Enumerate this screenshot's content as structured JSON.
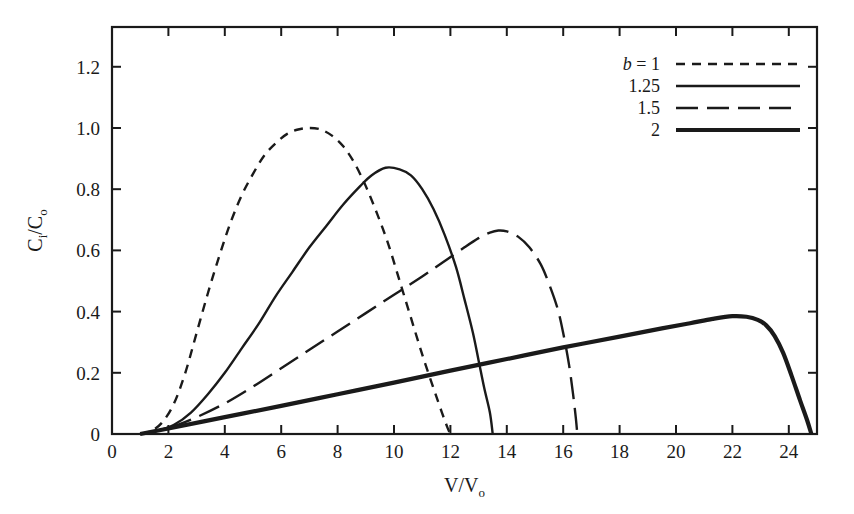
{
  "chart_data": {
    "type": "line",
    "title": "",
    "xlabel": "V/Vₒ",
    "xlabel_main": "V/V",
    "xlabel_sub": "o",
    "ylabel": "Cᵢ/Cₒ",
    "ylabel_main": "C/C",
    "ylabel_sub_1": "i",
    "ylabel_sub_2": "o",
    "xlim": [
      0,
      25
    ],
    "ylim": [
      0,
      1.33
    ],
    "xticks": [
      0,
      2,
      4,
      6,
      8,
      10,
      12,
      14,
      16,
      18,
      20,
      22,
      24
    ],
    "xtick_labels": [
      "0",
      "2",
      "4",
      "6",
      "8",
      "10",
      "12",
      "14",
      "16",
      "18",
      "20",
      "22",
      "24"
    ],
    "yticks": [
      0,
      0.2,
      0.4,
      0.6,
      0.8,
      1.0,
      1.2
    ],
    "ytick_labels": [
      "0",
      "0.2",
      "0.4",
      "0.6",
      "0.8",
      "1.0",
      "1.2"
    ],
    "grid": false,
    "ticks_inward": true,
    "ticks_on_top": true,
    "ticks_on_right": true,
    "legend_position": "top-right",
    "legend_prefix": "b =",
    "series": [
      {
        "name": "1",
        "legend_label": "1",
        "style": "short-dash",
        "dasharray": "9,7",
        "width": 2.4,
        "peak_x": 7.0,
        "peak_y": 1.0,
        "points": [
          [
            1.0,
            0.0
          ],
          [
            1.4,
            0.01
          ],
          [
            1.8,
            0.04
          ],
          [
            2.2,
            0.1
          ],
          [
            2.6,
            0.2
          ],
          [
            3.0,
            0.33
          ],
          [
            3.4,
            0.46
          ],
          [
            3.8,
            0.58
          ],
          [
            4.2,
            0.69
          ],
          [
            4.6,
            0.78
          ],
          [
            5.0,
            0.85
          ],
          [
            5.4,
            0.91
          ],
          [
            5.8,
            0.95
          ],
          [
            6.2,
            0.98
          ],
          [
            6.6,
            0.995
          ],
          [
            7.0,
            1.0
          ],
          [
            7.4,
            0.995
          ],
          [
            7.8,
            0.975
          ],
          [
            8.2,
            0.94
          ],
          [
            8.6,
            0.885
          ],
          [
            9.0,
            0.81
          ],
          [
            9.4,
            0.72
          ],
          [
            9.8,
            0.62
          ],
          [
            10.2,
            0.5
          ],
          [
            10.6,
            0.38
          ],
          [
            11.0,
            0.26
          ],
          [
            11.4,
            0.15
          ],
          [
            11.7,
            0.07
          ],
          [
            11.9,
            0.02
          ],
          [
            12.0,
            0.0
          ]
        ]
      },
      {
        "name": "1.25",
        "legend_label": "1.25",
        "style": "solid-thin",
        "dasharray": "none",
        "width": 2.4,
        "peak_x": 9.7,
        "peak_y": 0.87,
        "points": [
          [
            1.0,
            0.0
          ],
          [
            1.6,
            0.01
          ],
          [
            2.2,
            0.03
          ],
          [
            2.8,
            0.07
          ],
          [
            3.4,
            0.13
          ],
          [
            4.0,
            0.2
          ],
          [
            4.6,
            0.28
          ],
          [
            5.2,
            0.36
          ],
          [
            5.8,
            0.45
          ],
          [
            6.4,
            0.53
          ],
          [
            7.0,
            0.61
          ],
          [
            7.6,
            0.68
          ],
          [
            8.2,
            0.75
          ],
          [
            8.8,
            0.81
          ],
          [
            9.2,
            0.845
          ],
          [
            9.7,
            0.87
          ],
          [
            10.2,
            0.865
          ],
          [
            10.6,
            0.845
          ],
          [
            11.0,
            0.8
          ],
          [
            11.4,
            0.735
          ],
          [
            11.8,
            0.65
          ],
          [
            12.2,
            0.545
          ],
          [
            12.5,
            0.44
          ],
          [
            12.8,
            0.33
          ],
          [
            13.0,
            0.24
          ],
          [
            13.2,
            0.15
          ],
          [
            13.4,
            0.07
          ],
          [
            13.5,
            0.0
          ]
        ]
      },
      {
        "name": "1.5",
        "legend_label": "1.5",
        "style": "long-dash",
        "dasharray": "22,9",
        "width": 2.4,
        "peak_x": 13.7,
        "peak_y": 0.665,
        "points": [
          [
            1.0,
            0.0
          ],
          [
            2.0,
            0.02
          ],
          [
            3.0,
            0.055
          ],
          [
            4.0,
            0.1
          ],
          [
            5.0,
            0.155
          ],
          [
            6.0,
            0.215
          ],
          [
            7.0,
            0.275
          ],
          [
            8.0,
            0.335
          ],
          [
            9.0,
            0.395
          ],
          [
            10.0,
            0.455
          ],
          [
            11.0,
            0.515
          ],
          [
            11.8,
            0.565
          ],
          [
            12.5,
            0.61
          ],
          [
            13.0,
            0.64
          ],
          [
            13.4,
            0.658
          ],
          [
            13.7,
            0.665
          ],
          [
            14.0,
            0.662
          ],
          [
            14.4,
            0.645
          ],
          [
            14.8,
            0.61
          ],
          [
            15.2,
            0.555
          ],
          [
            15.5,
            0.49
          ],
          [
            15.8,
            0.41
          ],
          [
            16.0,
            0.33
          ],
          [
            16.2,
            0.23
          ],
          [
            16.35,
            0.13
          ],
          [
            16.45,
            0.05
          ],
          [
            16.5,
            0.0
          ]
        ]
      },
      {
        "name": "2",
        "legend_label": "2",
        "style": "solid-thick",
        "dasharray": "none",
        "width": 4.2,
        "peak_x": 22.0,
        "peak_y": 0.385,
        "points": [
          [
            1.0,
            0.0
          ],
          [
            2.0,
            0.018
          ],
          [
            4.0,
            0.055
          ],
          [
            6.0,
            0.092
          ],
          [
            8.0,
            0.13
          ],
          [
            10.0,
            0.168
          ],
          [
            12.0,
            0.207
          ],
          [
            14.0,
            0.245
          ],
          [
            16.0,
            0.283
          ],
          [
            18.0,
            0.318
          ],
          [
            19.5,
            0.345
          ],
          [
            20.5,
            0.362
          ],
          [
            21.3,
            0.376
          ],
          [
            22.0,
            0.385
          ],
          [
            22.5,
            0.383
          ],
          [
            22.9,
            0.373
          ],
          [
            23.2,
            0.355
          ],
          [
            23.5,
            0.32
          ],
          [
            23.8,
            0.265
          ],
          [
            24.1,
            0.19
          ],
          [
            24.4,
            0.11
          ],
          [
            24.65,
            0.045
          ],
          [
            24.8,
            0.0
          ]
        ]
      }
    ]
  }
}
